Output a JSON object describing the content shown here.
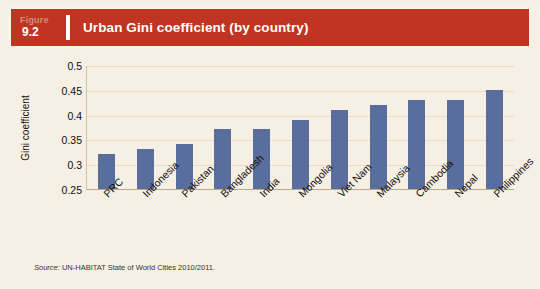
{
  "figure": {
    "label_word": "Figure",
    "number": "9.2",
    "title": "Urban Gini coefficient (by country)"
  },
  "source": {
    "lead": "Source:",
    "text": " UN-HABITAT State of World Cities 2010/2011."
  },
  "colors": {
    "banner_red": "#bf3522",
    "bar_blue": "#5a6e9d",
    "page_cream": "#f6efe3",
    "gridline": "#e6dcc9"
  },
  "chart_data": {
    "type": "bar",
    "title": "Urban Gini coefficient (by country)",
    "xlabel": "",
    "ylabel": "Gini coefficient",
    "ylim": [
      0.25,
      0.5
    ],
    "ytick_labels": [
      "0.5",
      "0.45",
      "0.4",
      "0.35",
      "0.3",
      "0.25"
    ],
    "yticks": [
      0.5,
      0.45,
      0.4,
      0.35,
      0.3,
      0.25
    ],
    "grid": true,
    "legend": "none",
    "categories": [
      "PRC",
      "Indonesia",
      "Pakistan",
      "Bangladesh",
      "India",
      "Mongolia",
      "Viet Nam",
      "Malaysia",
      "Cambodia",
      "Nepal",
      "Philippines"
    ],
    "values": [
      0.32,
      0.33,
      0.34,
      0.37,
      0.37,
      0.39,
      0.41,
      0.42,
      0.43,
      0.43,
      0.45
    ]
  }
}
